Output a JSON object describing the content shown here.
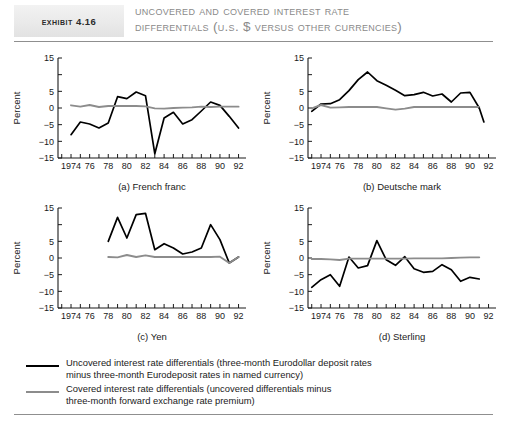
{
  "header": {
    "tag": "Exhibit 4.16",
    "title_line1": "Uncovered and Covered Interest Rate",
    "title_line2": "Differentials (U.S. $ versus Other Currencies)"
  },
  "legend": {
    "items": [
      {
        "style": "black-solid",
        "line1": "Uncovered interest rate differentials (three-month Eurodollar deposit rates",
        "line2": "minus three-month Eurodeposit rates in named currency)"
      },
      {
        "style": "gray-solid",
        "line1": "Covered interest rate differentials (uncovered differentials minus",
        "line2": "three-month forward exchange rate premium)"
      }
    ]
  },
  "axis": {
    "ylabel": "Percent",
    "ytick_labels": [
      "15",
      "5",
      "0",
      "-5",
      "-10",
      "-15"
    ],
    "ytick_values": [
      15,
      5,
      0,
      -5,
      -10,
      -15
    ],
    "ylim": [
      -15,
      15
    ],
    "xtick_labels": [
      "1974",
      "76",
      "78",
      "80",
      "82",
      "84",
      "86",
      "88",
      "90",
      "92"
    ],
    "xtick_values": [
      1974,
      1976,
      1978,
      1980,
      1982,
      1984,
      1986,
      1988,
      1990,
      1992
    ],
    "xlim": [
      1972.6,
      1992.8
    ]
  },
  "colors": {
    "uncovered": "#000000",
    "covered": "#8c8c8c",
    "axis": "#1a1a1a",
    "title": "#8a8a8a",
    "tag_bg": "#eaeaea",
    "rule": "#8f8f8f"
  },
  "chart_data": [
    {
      "type": "line",
      "id": "french-franc",
      "title": "(a) French franc",
      "xlabel": "",
      "ylabel": "Percent",
      "ylim": [
        -15,
        15
      ],
      "xlim": [
        1972.6,
        1992.8
      ],
      "grid": false,
      "legend_position": "below-figure",
      "x": [
        1974,
        1975,
        1976,
        1977,
        1978,
        1979,
        1980,
        1981,
        1982,
        1983,
        1984,
        1985,
        1986,
        1987,
        1988,
        1989,
        1990,
        1991,
        1992
      ],
      "series": [
        {
          "name": "Uncovered interest rate differentials",
          "color": "#000000",
          "values": [
            -8.0,
            -4.2,
            -4.8,
            -6.0,
            -4.5,
            3.4,
            2.8,
            4.8,
            3.7,
            -13.7,
            -3.0,
            -1.3,
            -4.8,
            -3.5,
            -0.9,
            1.8,
            0.8,
            -2.5,
            -6.0
          ]
        },
        {
          "name": "Covered interest rate differentials",
          "color": "#8c8c8c",
          "values": [
            0.8,
            0.4,
            0.9,
            0.3,
            0.6,
            0.6,
            0.6,
            0.6,
            0.5,
            -0.1,
            -0.2,
            0.0,
            0.1,
            0.2,
            0.4,
            0.3,
            0.4,
            0.4,
            0.4
          ]
        }
      ]
    },
    {
      "type": "line",
      "id": "deutsche-mark",
      "title": "(b) Deutsche mark",
      "xlabel": "",
      "ylabel": "Percent",
      "ylim": [
        -15,
        15
      ],
      "xlim": [
        1972.6,
        1992.8
      ],
      "grid": false,
      "legend_position": "below-figure",
      "x": [
        1973,
        1974,
        1975,
        1976,
        1977,
        1978,
        1979,
        1980,
        1981,
        1982,
        1983,
        1984,
        1985,
        1986,
        1987,
        1988,
        1989,
        1990,
        1991
      ],
      "series": [
        {
          "name": "Uncovered interest rate differentials",
          "color": "#000000",
          "values": [
            -1.0,
            1.2,
            1.3,
            2.5,
            5.2,
            8.5,
            10.8,
            8.2,
            6.8,
            5.3,
            3.7,
            4.0,
            4.7,
            3.6,
            4.2,
            1.8,
            4.5,
            4.7,
            0.0
          ]
        },
        {
          "name": "Covered interest rate differentials",
          "color": "#8c8c8c",
          "values": [
            -0.1,
            0.9,
            0.1,
            0.2,
            0.3,
            0.3,
            0.3,
            0.3,
            -0.1,
            -0.5,
            -0.2,
            0.3,
            0.3,
            0.3,
            0.3,
            0.3,
            0.3,
            0.3,
            0.3
          ]
        },
        {
          "name": "Uncovered tail",
          "color": "#000000",
          "values_x": [
            1991,
            1991.5
          ],
          "values": [
            0.0,
            -4.2
          ]
        }
      ]
    },
    {
      "type": "line",
      "id": "yen",
      "title": "(c) Yen",
      "xlabel": "",
      "ylabel": "Percent",
      "ylim": [
        -15,
        15
      ],
      "xlim": [
        1972.6,
        1992.8
      ],
      "grid": false,
      "legend_position": "below-figure",
      "x": [
        1978,
        1979,
        1980,
        1981,
        1982,
        1983,
        1984,
        1985,
        1986,
        1987,
        1988,
        1989,
        1990,
        1991,
        1992
      ],
      "series": [
        {
          "name": "Uncovered interest rate differentials",
          "color": "#000000",
          "values": [
            5.0,
            12.2,
            6.0,
            13.0,
            13.4,
            2.5,
            4.3,
            3.0,
            1.2,
            1.8,
            3.0,
            10.0,
            5.5,
            -1.5,
            0.3
          ]
        },
        {
          "name": "Covered interest rate differentials",
          "color": "#8c8c8c",
          "values": [
            0.3,
            0.2,
            0.9,
            0.3,
            0.8,
            0.3,
            0.3,
            0.3,
            0.3,
            0.3,
            0.3,
            0.3,
            0.4,
            -1.5,
            0.3
          ]
        }
      ]
    },
    {
      "type": "line",
      "id": "sterling",
      "title": "(d) Sterling",
      "xlabel": "",
      "ylabel": "Percent",
      "ylim": [
        -15,
        15
      ],
      "xlim": [
        1972.6,
        1992.8
      ],
      "grid": false,
      "legend_position": "below-figure",
      "x": [
        1973,
        1974,
        1975,
        1976,
        1977,
        1978,
        1979,
        1980,
        1981,
        1982,
        1983,
        1984,
        1985,
        1986,
        1987,
        1988,
        1989,
        1990,
        1991
      ],
      "series": [
        {
          "name": "Uncovered interest rate differentials",
          "color": "#000000",
          "values": [
            -8.8,
            -6.5,
            -5.0,
            -8.5,
            0.3,
            -3.0,
            -2.3,
            5.2,
            -0.5,
            -2.2,
            0.4,
            -3.2,
            -4.3,
            -4.0,
            -2.0,
            -3.5,
            -7.0,
            -5.8,
            -6.3
          ]
        },
        {
          "name": "Covered interest rate differentials",
          "color": "#8c8c8c",
          "values": [
            -0.3,
            -0.3,
            -0.4,
            -0.6,
            -0.2,
            -0.2,
            -0.2,
            -0.2,
            -0.2,
            -0.2,
            -0.2,
            -0.1,
            -0.1,
            -0.1,
            -0.1,
            0.0,
            0.1,
            0.2,
            0.2
          ]
        }
      ]
    }
  ]
}
